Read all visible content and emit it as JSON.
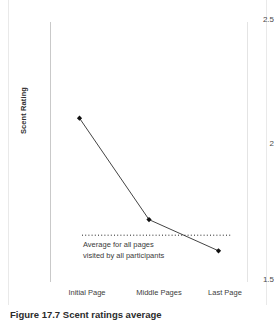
{
  "figure": {
    "caption": "Figure 17.7 Scent ratings average"
  },
  "chart_data": {
    "type": "line",
    "title": "",
    "xlabel": "",
    "ylabel": "Scent Rating",
    "categories": [
      "Initial Page",
      "Middle Pages",
      "Last Page"
    ],
    "values": [
      2.13,
      1.74,
      1.62
    ],
    "series": [
      {
        "name": "Scent Rating",
        "values": [
          2.13,
          1.74,
          1.62
        ]
      }
    ],
    "ylim": [
      1.5,
      2.5
    ],
    "ytick_labels": [
      "2.5",
      "2",
      "1.5"
    ],
    "ytick_values": [
      2.5,
      2.0,
      1.5
    ],
    "grid": false,
    "legend": "none",
    "marker": "filled-diamond",
    "line_color": "#444444",
    "marker_color": "#111111",
    "annotations": [
      {
        "name": "average-reference-line",
        "type": "horizontal-dotted-line",
        "value": 1.68,
        "label_line_1": "Average for all pages",
        "label_line_2": "visited by all participants",
        "color": "#222222"
      }
    ]
  }
}
